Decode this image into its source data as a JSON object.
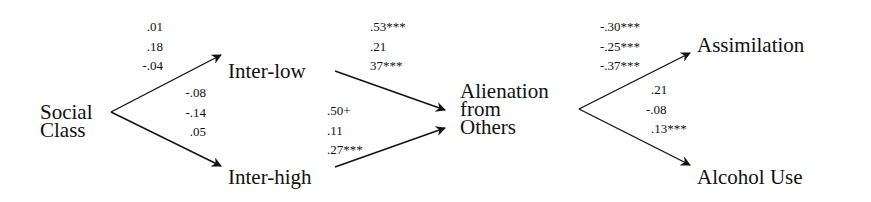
{
  "nodes": {
    "social_class": [
      "Social",
      "Class"
    ],
    "inter_low": "Inter-low",
    "inter_high": "Inter-high",
    "alienation": [
      "Alienation",
      "from",
      "Others"
    ],
    "assimilation": "Assimilation",
    "alcohol_use": "Alcohol Use"
  },
  "paths": {
    "social_to_interlow": [
      ".01",
      ".18",
      "-.04"
    ],
    "social_to_interhigh": [
      "-.08",
      "-.14",
      ".05"
    ],
    "interlow_to_alienation": [
      ".53***",
      ".21",
      "37***"
    ],
    "interhigh_to_alienation": [
      ".50+",
      ".11",
      ".27***"
    ],
    "alienation_to_assimilation": [
      "-.30***",
      "-.25***",
      "-.37***"
    ],
    "alienation_to_alcohol": [
      ".21",
      "-.08",
      ".13***"
    ]
  },
  "colors": {
    "ink": "#111111",
    "background": "#ffffff"
  }
}
